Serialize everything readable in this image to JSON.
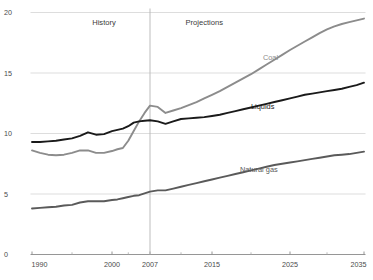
{
  "chart_data": {
    "type": "line",
    "title": "",
    "xlabel": "",
    "ylabel": "",
    "xlim": [
      1990,
      2035
    ],
    "ylim": [
      0,
      20
    ],
    "grid": true,
    "legend_position": "inline-labels",
    "xticks": [
      1990,
      2000,
      2007,
      2015,
      2025,
      2035
    ],
    "xtick_labels": [
      "1990",
      "2000",
      "2007",
      "2015",
      "2025",
      "2035"
    ],
    "yticks": [
      0,
      5,
      10,
      15,
      20
    ],
    "ytick_labels": [
      "0",
      "5",
      "10",
      "15",
      "20"
    ],
    "annotations": [
      {
        "name": "history",
        "text": "History",
        "x": 1999,
        "y": 19.0
      },
      {
        "name": "projections",
        "text": "Projections",
        "x": 2014,
        "y": 19.0
      },
      {
        "name": "divider",
        "text": "",
        "x": 2007,
        "y": 0
      }
    ],
    "series": [
      {
        "name": "Coal",
        "color": "#8c8c8c",
        "label": "Coal",
        "label_x": 2022.5,
        "label_y": 16.1,
        "x": [
          1990,
          1991,
          1992,
          1993,
          1994,
          1995,
          1996,
          1997,
          1998,
          1999,
          2000,
          2001,
          2002,
          2003,
          2004,
          2005,
          2006,
          2007,
          2008,
          2009,
          2010,
          2011,
          2012,
          2013,
          2014,
          2015,
          2016,
          2017,
          2018,
          2019,
          2020,
          2021,
          2022,
          2023,
          2024,
          2025,
          2026,
          2027,
          2028,
          2029,
          2030,
          2031,
          2032,
          2033,
          2034,
          2035
        ],
        "values": [
          8.6,
          8.4,
          8.25,
          8.2,
          8.25,
          8.4,
          8.6,
          8.6,
          8.4,
          8.4,
          8.55,
          8.7,
          8.8,
          9.4,
          10.2,
          11.0,
          11.7,
          12.3,
          12.2,
          11.7,
          11.9,
          12.1,
          12.35,
          12.6,
          12.9,
          13.2,
          13.5,
          13.85,
          14.2,
          14.55,
          14.9,
          15.3,
          15.7,
          16.1,
          16.5,
          16.9,
          17.25,
          17.6,
          17.95,
          18.3,
          18.6,
          18.85,
          19.05,
          19.2,
          19.35,
          19.5
        ]
      },
      {
        "name": "Liquids",
        "color": "#1a1a1a",
        "label": "Liquids",
        "label_x": 2021.5,
        "label_y": 12.0,
        "x": [
          1990,
          1991,
          1992,
          1993,
          1994,
          1995,
          1996,
          1997,
          1998,
          1999,
          2000,
          2001,
          2002,
          2003,
          2004,
          2005,
          2006,
          2007,
          2008,
          2009,
          2010,
          2011,
          2012,
          2013,
          2014,
          2015,
          2016,
          2017,
          2018,
          2019,
          2020,
          2021,
          2022,
          2023,
          2024,
          2025,
          2026,
          2027,
          2028,
          2029,
          2030,
          2031,
          2032,
          2033,
          2034,
          2035
        ],
        "values": [
          9.3,
          9.3,
          9.35,
          9.4,
          9.5,
          9.6,
          9.8,
          10.1,
          9.9,
          9.95,
          10.2,
          10.3,
          10.4,
          10.6,
          10.9,
          11.0,
          11.05,
          11.1,
          11.0,
          10.8,
          11.0,
          11.2,
          11.25,
          11.3,
          11.35,
          11.45,
          11.55,
          11.7,
          11.85,
          12.0,
          12.15,
          12.3,
          12.45,
          12.6,
          12.75,
          12.9,
          13.05,
          13.2,
          13.3,
          13.4,
          13.5,
          13.6,
          13.7,
          13.85,
          14.0,
          14.2
        ]
      },
      {
        "name": "Natural gas",
        "color": "#5a5a5a",
        "label": "Natural gas",
        "label_x": 2021,
        "label_y": 6.8,
        "x": [
          1990,
          1991,
          1992,
          1993,
          1994,
          1995,
          1996,
          1997,
          1998,
          1999,
          2000,
          2001,
          2002,
          2003,
          2004,
          2005,
          2006,
          2007,
          2008,
          2009,
          2010,
          2011,
          2012,
          2013,
          2014,
          2015,
          2016,
          2017,
          2018,
          2019,
          2020,
          2021,
          2022,
          2023,
          2024,
          2025,
          2026,
          2027,
          2028,
          2029,
          2030,
          2031,
          2032,
          2033,
          2034,
          2035
        ],
        "values": [
          3.8,
          3.85,
          3.9,
          3.95,
          4.05,
          4.1,
          4.3,
          4.4,
          4.4,
          4.4,
          4.5,
          4.55,
          4.65,
          4.75,
          4.85,
          4.9,
          5.05,
          5.2,
          5.3,
          5.3,
          5.45,
          5.6,
          5.75,
          5.9,
          6.05,
          6.2,
          6.35,
          6.5,
          6.65,
          6.8,
          6.95,
          7.1,
          7.25,
          7.4,
          7.5,
          7.6,
          7.7,
          7.8,
          7.9,
          8.0,
          8.1,
          8.2,
          8.25,
          8.3,
          8.4,
          8.5
        ]
      }
    ]
  }
}
